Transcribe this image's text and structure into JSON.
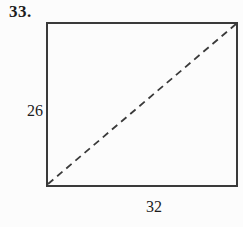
{
  "figure": {
    "problem_number": "33.",
    "shape": "rectangle-with-dashed-diagonal",
    "height_label": "26",
    "width_label": "32"
  },
  "colors": {
    "line": "#3a3a3a",
    "text": "#1d1d1d",
    "background": "#fcfcfc"
  }
}
